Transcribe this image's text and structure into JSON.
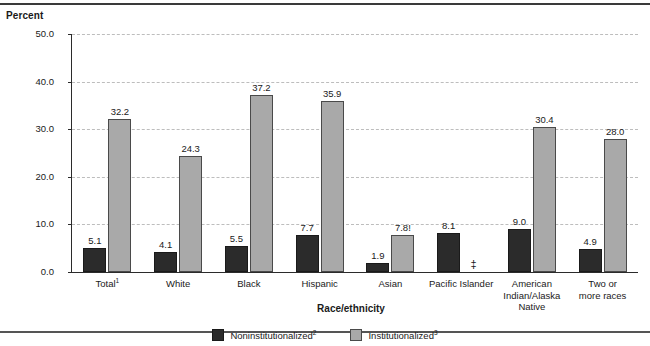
{
  "chart_data": {
    "type": "bar",
    "title": "",
    "xlabel": "Race/ethnicity",
    "ylabel": "Percent",
    "ylim": [
      0,
      50
    ],
    "ytick_labels": [
      "0.0",
      "10.0",
      "20.0",
      "30.0",
      "40.0",
      "50.0"
    ],
    "ytick_values": [
      0,
      10,
      20,
      30,
      40,
      50
    ],
    "grid": true,
    "legend_position": "bottom",
    "categories": [
      "Total",
      "White",
      "Black",
      "Hispanic",
      "Asian",
      "Pacific Islander",
      "American Indian/Alaska Native",
      "Two or more races"
    ],
    "category_labels": [
      [
        "Total",
        "1"
      ],
      [
        "White",
        ""
      ],
      [
        "Black",
        ""
      ],
      [
        "Hispanic",
        ""
      ],
      [
        "Asian",
        ""
      ],
      [
        "Pacific Islander",
        ""
      ],
      [
        "American Indian/Alaska Native",
        ""
      ],
      [
        "Two or more races",
        ""
      ]
    ],
    "series": [
      {
        "name": "Noninstitutionalized",
        "footnote": "2",
        "color": "#2b2b2b",
        "values": [
          5.1,
          4.1,
          5.5,
          7.7,
          1.9,
          8.1,
          9.0,
          4.9
        ],
        "value_labels": [
          "5.1",
          "4.1",
          "5.5",
          "7.7",
          "1.9",
          "8.1",
          "9.0",
          "4.9"
        ]
      },
      {
        "name": "Institutionalized",
        "footnote": "3",
        "color": "#a9a9a9",
        "values": [
          32.2,
          24.3,
          37.2,
          35.9,
          7.8,
          null,
          30.4,
          28.0
        ],
        "value_labels": [
          "32.2",
          "24.3",
          "37.2",
          "35.9",
          "7.8!",
          "‡",
          "30.4",
          "28.0"
        ],
        "suppressed": [
          false,
          false,
          false,
          false,
          false,
          true,
          false,
          false
        ]
      }
    ],
    "annotations": {
      "unstable_estimate_marker": "!",
      "suppressed_marker": "‡"
    }
  },
  "axes": {
    "y_title": "Percent",
    "x_title": "Race/ethnicity"
  },
  "legend": {
    "items": [
      {
        "label": "Noninstitutionalized",
        "footnote": "2"
      },
      {
        "label": "Institutionalized",
        "footnote": "3"
      }
    ]
  },
  "ticks": {
    "y": [
      "50.0",
      "40.0",
      "30.0",
      "20.0",
      "10.0",
      "0.0"
    ]
  }
}
